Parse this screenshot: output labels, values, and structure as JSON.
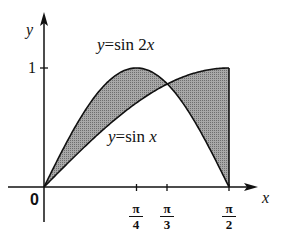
{
  "chart_data": {
    "type": "area",
    "title": "",
    "xlabel": "x",
    "ylabel": "y",
    "xlim": [
      0,
      1.5708
    ],
    "ylim": [
      0,
      1
    ],
    "grid": false,
    "x_ticks": [
      {
        "value": 0.7854,
        "num": "π",
        "den": "4"
      },
      {
        "value": 1.0472,
        "num": "π",
        "den": "3"
      },
      {
        "value": 1.5708,
        "num": "π",
        "den": "2"
      }
    ],
    "y_ticks": [
      {
        "value": 1,
        "label": "1"
      }
    ],
    "origin_label": "0",
    "series": [
      {
        "name": "y=sin 2x",
        "function": "sin(2x)",
        "x": [
          0,
          0.3927,
          0.7854,
          1.0472,
          1.1781,
          1.5708
        ],
        "values": [
          0,
          0.707,
          1,
          0.866,
          0.707,
          0
        ]
      },
      {
        "name": "y=sin x",
        "function": "sin(x)",
        "x": [
          0,
          0.3927,
          0.7854,
          1.0472,
          1.1781,
          1.5708
        ],
        "values": [
          0,
          0.383,
          0.707,
          0.866,
          0.924,
          1
        ]
      }
    ],
    "annotations": [
      {
        "text": "y=sin 2x",
        "position": "above curve peak"
      },
      {
        "text": "y=sin x",
        "position": "below curves, right of center"
      }
    ],
    "shaded_region": "between y=sin x and y=sin 2x from 0 to π/2",
    "intersection_x": 1.0472
  },
  "labels": {
    "y_axis": "y",
    "x_axis": "x",
    "origin": "0",
    "one": "1",
    "sin2x_label": "y=sin 2x",
    "sinx_label": "y=sin x",
    "tick_pi4_num": "π",
    "tick_pi4_den": "4",
    "tick_pi3_num": "π",
    "tick_pi3_den": "3",
    "tick_pi2_num": "π",
    "tick_pi2_den": "2"
  },
  "colors": {
    "fill": "#8c8c8c",
    "stroke": "#111111"
  }
}
